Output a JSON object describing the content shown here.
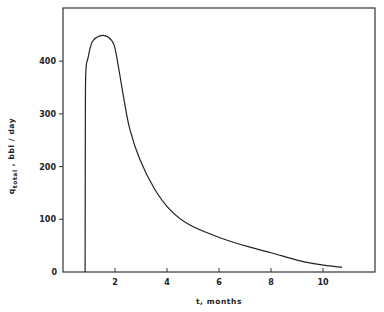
{
  "chart_data": {
    "type": "line",
    "title": "",
    "xlabel": "t, months",
    "ylabel": "q_total , bbl / day",
    "ylabel_parts": {
      "main": "q",
      "subscript": "total",
      "rest": " ,  bbl / day"
    },
    "xlim": [
      0,
      11.8
    ],
    "ylim": [
      0,
      490
    ],
    "xticks": [
      2,
      4,
      6,
      8,
      10
    ],
    "yticks": [
      0,
      100,
      200,
      300,
      400
    ],
    "xtick_labels": [
      "2",
      "4",
      "6",
      "8",
      "10"
    ],
    "ytick_labels": [
      "0",
      "100",
      "200",
      "300",
      "400"
    ],
    "grid": false,
    "legend": null,
    "series": [
      {
        "name": "q_total",
        "x": [
          0.85,
          0.86,
          0.88,
          0.96,
          1.12,
          1.42,
          1.73,
          1.96,
          2.12,
          2.35,
          2.58,
          2.96,
          3.54,
          4.12,
          4.88,
          6.04,
          7.19,
          8.04,
          9.12,
          10.04,
          10.73
        ],
        "y": [
          0,
          300,
          383,
          406,
          436,
          448,
          446,
          431,
          393,
          326,
          269,
          213,
          156,
          118,
          89,
          65,
          47,
          36,
          21,
          13,
          9
        ]
      }
    ]
  },
  "colors": {
    "line": "#222222",
    "axis": "#333333",
    "background": "#ffffff"
  }
}
